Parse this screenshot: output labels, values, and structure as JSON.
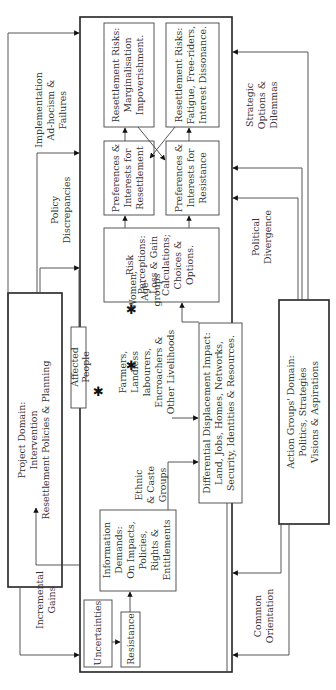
{
  "diagram": {
    "orientation": "rotated-90-ccw",
    "project_domain": {
      "lines": [
        "Project Domain:",
        "Intervention",
        "Resettlement Policies & Planning"
      ]
    },
    "action_groups_domain": {
      "lines": [
        "Action Groups' Domain:",
        "Politics, Strategies",
        "Visions & Aspirations"
      ]
    },
    "left_flows": [
      {
        "id": "implementation",
        "lines": [
          "Implementation",
          "Ad-hocism &",
          "Failures"
        ]
      },
      {
        "id": "policy",
        "lines": [
          "Policy",
          "Discrepancies"
        ]
      },
      {
        "id": "incremental",
        "lines": [
          "Incremental",
          "Gains"
        ]
      }
    ],
    "right_flows": [
      {
        "id": "strategic",
        "lines": [
          "Strategic",
          "Options &",
          "Dilemmas"
        ]
      },
      {
        "id": "political",
        "lines": [
          "Political",
          "Divergence"
        ]
      },
      {
        "id": "common",
        "lines": [
          "Common",
          "Orientation"
        ]
      }
    ],
    "boxes": {
      "risks_marginalisation": [
        "Resettlement Risks:",
        "Marginalisation",
        "Impoverishment."
      ],
      "risks_fatigue": [
        "Resettlement Risks:",
        "Fatigue, Free-riders,",
        "Interest Dissonance."
      ],
      "pref_resettlement": [
        "Preferences &",
        "Interests for",
        "Resettlement"
      ],
      "pref_resistance": [
        "Preferences &",
        "Interests for",
        "Resistance"
      ],
      "risk_perceptions": [
        "Risk",
        "Perceptions:",
        "Loss & Gain",
        "Calculations;",
        "Choices &",
        "Options."
      ],
      "affected_people": [
        "Affected",
        "People"
      ],
      "differential_impact": [
        "Differential Displacement Impact:",
        "Land, Jobs, Homes, Networks,",
        "Security, Identities & Resources."
      ],
      "information_demands": [
        "Information",
        "Demands:",
        "On Impacts,",
        "Policies,",
        "Rights &",
        "Entitlements"
      ],
      "uncertainties": [
        "Uncertainties"
      ],
      "resistance": [
        "Resistance"
      ]
    },
    "groups": {
      "women": [
        "Women,",
        "Age-",
        "groups"
      ],
      "farmers": [
        "Farmers,",
        "Landless",
        "labourers,",
        "Encroachers &",
        "Other Livelihoods"
      ],
      "ethnic": [
        "Ethnic",
        "& Caste",
        "Groups"
      ]
    },
    "markers": {
      "star": "✱"
    }
  }
}
